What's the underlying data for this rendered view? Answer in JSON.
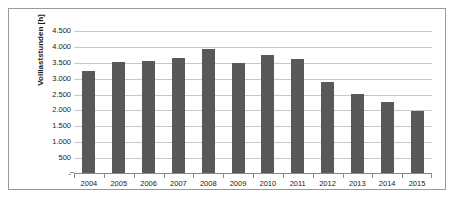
{
  "chart_data": {
    "type": "bar",
    "title": "",
    "subtitle": "",
    "xlabel": "",
    "ylabel": "Volllaststunden [h]",
    "categories": [
      "2004",
      "2005",
      "2006",
      "2007",
      "2008",
      "2009",
      "2010",
      "2011",
      "2012",
      "2013",
      "2014",
      "2015"
    ],
    "values": [
      3250,
      3530,
      3560,
      3660,
      3920,
      3500,
      3760,
      3610,
      2890,
      2530,
      2270,
      1990
    ],
    "series": [
      {
        "name": "Volllaststunden",
        "values": [
          3250,
          3530,
          3560,
          3660,
          3920,
          3500,
          3760,
          3610,
          2890,
          2530,
          2270,
          1990
        ],
        "color": "#595959"
      }
    ],
    "ylim": [
      0,
      4500
    ],
    "ytick_values": [
      0,
      500,
      1000,
      1500,
      2000,
      2500,
      3000,
      3500,
      4000,
      4500
    ],
    "ytick_labels": [
      "-",
      "500",
      "1.000",
      "1.500",
      "2.000",
      "2.500",
      "3.000",
      "3.500",
      "4.000",
      "4.500"
    ],
    "grid": true,
    "grid_axis": "y",
    "legend": false,
    "legend_position": "none",
    "bar_color": "#595959",
    "gridline_color": "#c8c8c8",
    "axis_color": "#8a8a8a",
    "frame_color": "#9a9a9a",
    "background_color": "#ffffff",
    "text_color": "#1a1a1a"
  }
}
